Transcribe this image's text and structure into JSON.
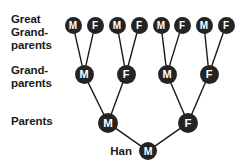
{
  "diagram": {
    "background_color": "#ffffff",
    "node_fill_color": "#242424",
    "node_text_color": "#ffffff",
    "edge_color": "#1a1a1a",
    "label_color": "#1a1a1a"
  },
  "row_labels": {
    "great_grandparents": "Great\nGrand-\nparents",
    "grandparents": "Grand-\nparents",
    "parents": "Parents"
  },
  "generations": [
    {
      "key": "great_grandparents",
      "label": "Great Grand-parents",
      "count": 8,
      "nodes": [
        {
          "id": "gg1",
          "sex": "M",
          "x": 73,
          "y": 25
        },
        {
          "id": "gg2",
          "sex": "F",
          "x": 95,
          "y": 25
        },
        {
          "id": "gg3",
          "sex": "M",
          "x": 117,
          "y": 25
        },
        {
          "id": "gg4",
          "sex": "F",
          "x": 139,
          "y": 25
        },
        {
          "id": "gg5",
          "sex": "M",
          "x": 161,
          "y": 25
        },
        {
          "id": "gg6",
          "sex": "F",
          "x": 182,
          "y": 25
        },
        {
          "id": "gg7",
          "sex": "M",
          "x": 204,
          "y": 25
        },
        {
          "id": "gg8",
          "sex": "F",
          "x": 226,
          "y": 25
        }
      ]
    },
    {
      "key": "grandparents",
      "label": "Grand-parents",
      "count": 4,
      "nodes": [
        {
          "id": "gp1",
          "sex": "M",
          "x": 84,
          "y": 74
        },
        {
          "id": "gp2",
          "sex": "F",
          "x": 126,
          "y": 74
        },
        {
          "id": "gp3",
          "sex": "M",
          "x": 167,
          "y": 74
        },
        {
          "id": "gp4",
          "sex": "F",
          "x": 209,
          "y": 74
        }
      ]
    },
    {
      "key": "parents",
      "label": "Parents",
      "count": 2,
      "nodes": [
        {
          "id": "p1",
          "sex": "M",
          "x": 108,
          "y": 123
        },
        {
          "id": "p2",
          "sex": "F",
          "x": 188,
          "y": 123
        }
      ]
    },
    {
      "key": "child",
      "label": "Han",
      "count": 1,
      "nodes": [
        {
          "id": "c1",
          "sex": "M",
          "x": 148,
          "y": 151
        }
      ]
    }
  ],
  "child": {
    "name": "Han",
    "sex": "M",
    "name_x": 139,
    "name_y": 151
  },
  "edges": [
    {
      "from": "gg1",
      "to": "gp1"
    },
    {
      "from": "gg2",
      "to": "gp1"
    },
    {
      "from": "gg3",
      "to": "gp2"
    },
    {
      "from": "gg4",
      "to": "gp2"
    },
    {
      "from": "gg5",
      "to": "gp3"
    },
    {
      "from": "gg6",
      "to": "gp3"
    },
    {
      "from": "gg7",
      "to": "gp4"
    },
    {
      "from": "gg8",
      "to": "gp4"
    },
    {
      "from": "gp1",
      "to": "p1"
    },
    {
      "from": "gp2",
      "to": "p1"
    },
    {
      "from": "gp3",
      "to": "p2"
    },
    {
      "from": "gp4",
      "to": "p2"
    },
    {
      "from": "p1",
      "to": "c1"
    },
    {
      "from": "p2",
      "to": "c1"
    }
  ]
}
